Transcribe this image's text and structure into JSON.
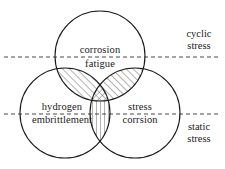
{
  "diagram": {
    "type": "venn-3-circle",
    "colors": {
      "stroke": "#1a1a1a",
      "hatch": "#555555",
      "dashed_line": "#333333",
      "background": "#ffffff",
      "text": "#1a1a1a"
    },
    "circles": [
      {
        "id": "top",
        "name": "corrosion-fatigue-circle",
        "cx": 100,
        "cy": 56,
        "r": 45
      },
      {
        "id": "left",
        "name": "hydrogen-embrittlement-circle",
        "cx": 65,
        "cy": 113,
        "r": 45
      },
      {
        "id": "right",
        "name": "stress-corrosion-circle",
        "cx": 135,
        "cy": 113,
        "r": 45
      }
    ],
    "dashed_lines": [
      {
        "id": "upper",
        "name": "cyclic-static-upper-divider",
        "y": 57,
        "x1": 4,
        "x2": 221
      },
      {
        "id": "lower",
        "name": "cyclic-static-lower-divider",
        "y": 114,
        "x1": 4,
        "x2": 221
      }
    ],
    "hatched_regions": [
      {
        "id": "top-left-lens",
        "pattern": "diagonal-forward",
        "description": "corrosion fatigue circle intersect hydrogen embrittlement circle"
      },
      {
        "id": "top-right-lens",
        "pattern": "diagonal-forward",
        "description": "corrosion fatigue circle intersect stress corrosion circle"
      },
      {
        "id": "center",
        "pattern": "crosshatch",
        "description": "all three circles intersect"
      },
      {
        "id": "bottom-lens",
        "pattern": "vertical",
        "description": "hydrogen embrittlement circle intersect stress corrosion circle"
      }
    ],
    "labels": {
      "corrosion": "corrosion",
      "fatigue": "fatigue",
      "hydrogen": "hydrogen",
      "embrittlement": "embrittlement",
      "stress": "stress",
      "corrsion": "corrsion",
      "cyclic": "cyclic",
      "cyclic_stress": "stress",
      "static": "static",
      "static_stress": "stress"
    }
  }
}
